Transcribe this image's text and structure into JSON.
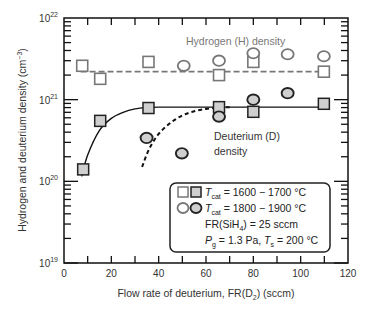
{
  "chart_data": {
    "type": "scatter",
    "title": "",
    "xlabel": "Flow rate of deuterium, FR(D",
    "xlabel_sub": "2",
    "xlabel_end": ") (sccm)",
    "ylabel": "Hydrogen and deuterium density (cm",
    "ylabel_sup": "−3",
    "ylabel_end": ")",
    "xlim": [
      0,
      120
    ],
    "ylim": [
      1e+19,
      1e+22
    ],
    "yscale": "log",
    "x_ticks": [
      0,
      20,
      40,
      60,
      80,
      100,
      120
    ],
    "y_ticks": [
      {
        "base": "10",
        "exp": "19",
        "value": 1e+19
      },
      {
        "base": "10",
        "exp": "20",
        "value": 1e+20
      },
      {
        "base": "10",
        "exp": "21",
        "value": 1e+21
      },
      {
        "base": "10",
        "exp": "22",
        "value": 1e+22
      }
    ],
    "grid": false,
    "annotations": {
      "hydrogen": "Hydrogen (H) density",
      "deuterium_line1": "Deuterium (D)",
      "deuterium_line2": "density"
    },
    "series": [
      {
        "name": "H density, Tcat = 1600–1700 °C",
        "marker": "square-open",
        "x": [
          7.7,
          15.3,
          35.7,
          65.5,
          80,
          109.8
        ],
        "y": [
          2.6e+21,
          1.8e+21,
          2.9e+21,
          2e+21,
          2.9e+21,
          2.2e+21
        ]
      },
      {
        "name": "H density, Tcat = 1800–1900 °C",
        "marker": "circle-open",
        "x": [
          50.6,
          65.5,
          80,
          94.5,
          109.8
        ],
        "y": [
          2.6e+21,
          3e+21,
          3.7e+21,
          3.6e+21,
          3.4e+21
        ]
      },
      {
        "name": "D density, Tcat = 1600–1700 °C",
        "marker": "square-filled",
        "x": [
          8.1,
          15.3,
          35.7,
          65.5,
          80,
          109.8
        ],
        "y": [
          1.4e+20,
          5.5e+20,
          7.9e+20,
          8.1e+20,
          7.1e+20,
          8.9e+20
        ]
      },
      {
        "name": "D density, Tcat = 1800–1900 °C",
        "marker": "circle-filled",
        "x": [
          34.9,
          49.8,
          65.5,
          80,
          94.5
        ],
        "y": [
          3.4e+20,
          2.2e+20,
          6.2e+20,
          1e+21,
          1.2e+21
        ]
      }
    ],
    "fit_lines": [
      {
        "name": "H mean (dashed)",
        "style": "dashed",
        "x": [
          7,
          112
        ],
        "y": [
          2.2e+21,
          2.2e+21
        ]
      },
      {
        "name": "D fit 1600–1700 °C (solid)",
        "style": "solid",
        "x": [
          7.5,
          10,
          15,
          20,
          25,
          30,
          35,
          40,
          60,
          80,
          112
        ],
        "y": [
          1.15e+20,
          2.1e+20,
          4.2e+20,
          5.9e+20,
          7e+20,
          7.7e+20,
          8e+20,
          8.1e+20,
          8.1e+20,
          8.1e+20,
          8.1e+20
        ]
      },
      {
        "name": "D fit 1800–1900 °C (dashed)",
        "style": "dashed",
        "x": [
          33,
          36,
          40,
          45,
          50,
          55,
          60,
          65,
          70
        ],
        "y": [
          1.5e+20,
          2.5e+20,
          3.8e+20,
          5.2e+20,
          6.4e+20,
          7.2e+20,
          7.7e+20,
          8e+20,
          8.1e+20
        ]
      }
    ],
    "legend": {
      "placement": "bottom-right",
      "row1": "T",
      "row1_sub": "cat",
      "row1_text": " = 1600 − 1700 °C",
      "row2": "T",
      "row2_sub": "cat",
      "row2_text": " = 1800 − 1900 °C",
      "row3_a": "FR(SiH",
      "row3_sub": "4",
      "row3_b": ") = 25 sccm",
      "row4_a": "P",
      "row4_sub1": "g",
      "row4_b": " = 1.3 Pa, ",
      "row4_c": "T",
      "row4_sub2": "s",
      "row4_d": " = 200 °C"
    },
    "colors": {
      "open_marker_stroke": "#777777",
      "filled_marker_fill": "#cfcfcf",
      "filled_marker_stroke": "#222222",
      "axis": "#111111"
    }
  }
}
